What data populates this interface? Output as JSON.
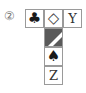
{
  "figure": {
    "label": "②",
    "top_row": [
      {
        "id": "club",
        "symbol": "♣",
        "kind": "icon"
      },
      {
        "id": "diamond",
        "symbol": "◇",
        "kind": "icon"
      },
      {
        "id": "y",
        "symbol": "Y",
        "kind": "letter"
      }
    ],
    "column": [
      {
        "id": "diagonal",
        "symbol": "",
        "kind": "shaded-diagonal"
      },
      {
        "id": "spade",
        "symbol": "♠",
        "kind": "icon"
      },
      {
        "id": "z",
        "symbol": "Z",
        "kind": "letter"
      }
    ],
    "colors": {
      "border": "#9a9a9a",
      "shade": "#5a5a5a",
      "ink": "#1a1a1a"
    }
  }
}
